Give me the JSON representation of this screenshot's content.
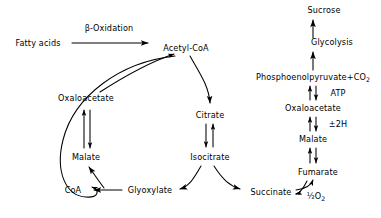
{
  "diagram": {
    "background_color": "#ffffff",
    "stroke_color": "#000000",
    "nodes": [
      {
        "id": "fatty_acids",
        "label": "Fatty acids",
        "x": 38,
        "y": 43
      },
      {
        "id": "acetyl_coa",
        "label": "Acetyl-CoA",
        "x": 186,
        "y": 48
      },
      {
        "id": "oxaloacetate_left",
        "label": "Oxaloacetate",
        "x": 86,
        "y": 98
      },
      {
        "id": "citrate",
        "label": "Citrate",
        "x": 210,
        "y": 115
      },
      {
        "id": "malate_left",
        "label": "Malate",
        "x": 86,
        "y": 157
      },
      {
        "id": "isocitrate",
        "label": "Isocitrate",
        "x": 210,
        "y": 157
      },
      {
        "id": "coa",
        "label": "CoA",
        "x": 73,
        "y": 190
      },
      {
        "id": "glyoxylate",
        "label": "Glyoxylate",
        "x": 150,
        "y": 190
      },
      {
        "id": "succinate",
        "label": "Succinate",
        "x": 271,
        "y": 192
      },
      {
        "id": "sucrose",
        "label": "Sucrose",
        "x": 324,
        "y": 10
      },
      {
        "id": "glycolysis",
        "label": "Glycolysis",
        "x": 332,
        "y": 42
      },
      {
        "id": "pep",
        "label": "Phosphoenolpyruvate+CO2",
        "x": 313,
        "y": 77
      },
      {
        "id": "oxaloacetate_right",
        "label": "Oxaloacetate",
        "x": 313,
        "y": 108
      },
      {
        "id": "malate_right",
        "label": "Malate",
        "x": 313,
        "y": 139
      },
      {
        "id": "fumarate",
        "label": "Fumarate",
        "x": 318,
        "y": 172
      }
    ],
    "edge_labels": [
      {
        "id": "beta_oxidation",
        "label": "β-Oxidation",
        "x": 109,
        "y": 28
      },
      {
        "id": "atp",
        "label": "ATP",
        "x": 338,
        "y": 93
      },
      {
        "id": "two_h",
        "label": "±2H",
        "x": 338,
        "y": 124
      },
      {
        "id": "half_o2",
        "label": "½O2",
        "x": 316,
        "y": 196
      }
    ]
  }
}
